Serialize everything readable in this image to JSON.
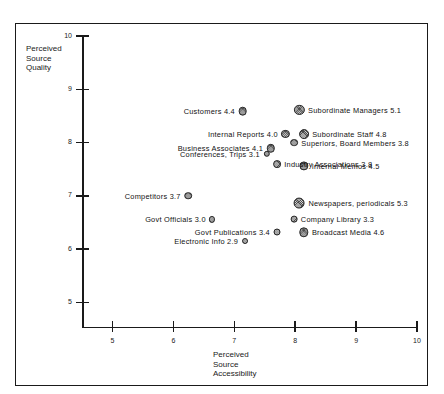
{
  "chart_data": {
    "type": "scatter",
    "title": "",
    "xlabel": "Perceived\nSource\nAccessibility",
    "ylabel": "Perceived\nSource\nQuality",
    "xlim": [
      4.5,
      10
    ],
    "ylim": [
      4.55,
      10
    ],
    "xticks": [
      "5",
      "6",
      "7",
      "8",
      "9",
      "10"
    ],
    "yticks": [
      "10",
      "9",
      "8",
      "7",
      "6",
      "5"
    ],
    "grid": false,
    "legend": "none",
    "size_note": "Marker area scales with the numeric value shown in each label",
    "points": [
      {
        "label": "Customers 4.4",
        "name": "Customers",
        "value": 4.4,
        "x": 7.14,
        "y": 8.59,
        "side": "left",
        "r": 4.2
      },
      {
        "label": "Subordinate Managers 5.1",
        "name": "Subordinate Managers",
        "value": 5.1,
        "x": 8.07,
        "y": 8.61,
        "side": "right",
        "r": 5.0
      },
      {
        "label": "Internal Reports 4.0",
        "name": "Internal Reports",
        "value": 4.0,
        "x": 7.84,
        "y": 8.17,
        "side": "left",
        "r": 4.0
      },
      {
        "label": "Subordinate Staff 4.8",
        "name": "Subordinate Staff",
        "value": 4.8,
        "x": 8.14,
        "y": 8.16,
        "side": "right",
        "r": 4.8
      },
      {
        "label": "Superiors, Board Members 3.8",
        "name": "Superiors, Board Members",
        "value": 3.8,
        "x": 7.98,
        "y": 8.0,
        "side": "right",
        "r": 3.8
      },
      {
        "label": "Business Associates 4.1",
        "name": "Business Associates",
        "value": 4.1,
        "x": 7.6,
        "y": 7.89,
        "side": "left",
        "r": 4.1
      },
      {
        "label": "Internal Memos 4.5",
        "name": "Internal Memos",
        "value": 4.5,
        "x": 8.14,
        "y": 7.57,
        "side": "right",
        "r": 4.5
      },
      {
        "label": "Conferences, Trips 3.1",
        "name": "Conferences, Trips",
        "value": 3.1,
        "x": 7.53,
        "y": 7.79,
        "side": "left",
        "r": 3.1
      },
      {
        "label": "Industry Associations 3.8",
        "name": "Industry Associations",
        "value": 3.8,
        "x": 7.7,
        "y": 7.59,
        "side": "right",
        "r": 3.8
      },
      {
        "label": "Competitors 3.7",
        "name": "Competitors",
        "value": 3.7,
        "x": 6.24,
        "y": 7.0,
        "side": "left",
        "r": 3.7
      },
      {
        "label": "Newspapers, periodicals 5.3",
        "name": "Newspapers, periodicals",
        "value": 5.3,
        "x": 8.07,
        "y": 6.86,
        "side": "right",
        "r": 5.3
      },
      {
        "label": "Company Library 3.3",
        "name": "Company Library",
        "value": 3.3,
        "x": 7.98,
        "y": 6.56,
        "side": "right",
        "r": 3.3
      },
      {
        "label": "Govt Officials 3.0",
        "name": "Govt Officials",
        "value": 3.0,
        "x": 6.64,
        "y": 6.56,
        "side": "left",
        "r": 3.0
      },
      {
        "label": "Govt Publications 3.4",
        "name": "Govt Publications",
        "value": 3.4,
        "x": 7.7,
        "y": 6.33,
        "side": "left",
        "r": 3.4
      },
      {
        "label": "Broadcast Media 4.6",
        "name": "Broadcast Media",
        "value": 4.6,
        "x": 8.14,
        "y": 6.32,
        "side": "right",
        "r": 4.6
      },
      {
        "label": "Electronic Info 2.9",
        "name": "Electronic Info",
        "value": 2.9,
        "x": 7.17,
        "y": 6.16,
        "side": "left",
        "r": 2.9
      }
    ]
  }
}
